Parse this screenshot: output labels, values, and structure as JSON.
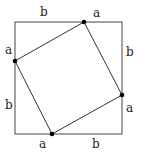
{
  "diagram": {
    "outer_square": {
      "x": 15,
      "y": 22,
      "size": 107
    },
    "inner_points": [
      {
        "name": "top",
        "x": 84,
        "y": 22
      },
      {
        "name": "right",
        "x": 122,
        "y": 95
      },
      {
        "name": "bottom",
        "x": 52,
        "y": 134
      },
      {
        "name": "left",
        "x": 15,
        "y": 61
      }
    ],
    "labels": [
      {
        "id": "top-b",
        "text": "b",
        "x": 43,
        "y": 16
      },
      {
        "id": "top-a",
        "text": "a",
        "x": 96,
        "y": 17
      },
      {
        "id": "right-b",
        "text": "b",
        "x": 130,
        "y": 55
      },
      {
        "id": "right-a",
        "text": "a",
        "x": 130,
        "y": 111
      },
      {
        "id": "bottom-a",
        "text": "a",
        "x": 42,
        "y": 147
      },
      {
        "id": "bottom-b",
        "text": "b",
        "x": 95,
        "y": 147
      },
      {
        "id": "left-b",
        "text": "b",
        "x": 9,
        "y": 108
      },
      {
        "id": "left-a",
        "text": "a",
        "x": 9,
        "y": 54
      }
    ],
    "line_color": "#333333",
    "point_color": "#000000"
  }
}
